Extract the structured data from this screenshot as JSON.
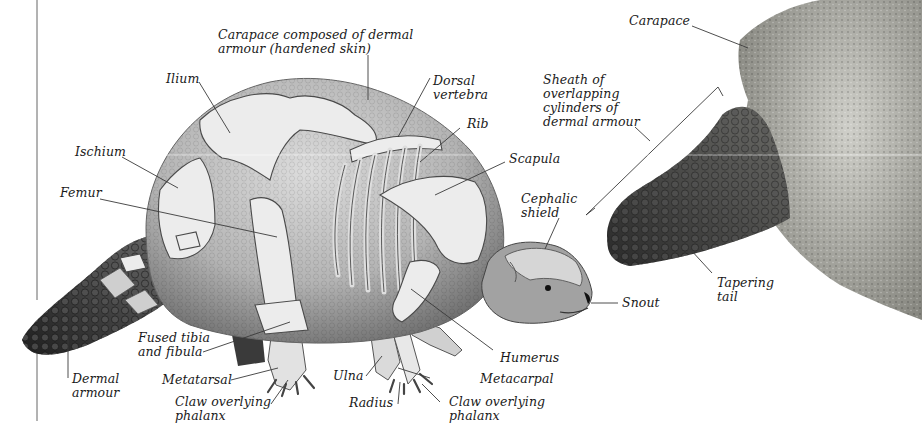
{
  "diagram": {
    "colors": {
      "background": "#ffffff",
      "label_text": "#1a1a1a",
      "leader_line": "#3a3a3a",
      "carapace_light": "#cfcfcf",
      "carapace_dark": "#8a8a8a",
      "bone": "#e6e6e6",
      "armour_dark": "#3e3e3e",
      "detail_carapace": "#9a9a94"
    },
    "main_figure": {
      "labels": [
        {
          "id": "carapace-composed",
          "text": "Carapace composed of dermal\narmour (hardened skin)"
        },
        {
          "id": "ilium",
          "text": "Ilium"
        },
        {
          "id": "dorsal-vertebra",
          "text": "Dorsal\nvertebra"
        },
        {
          "id": "rib",
          "text": "Rib"
        },
        {
          "id": "ischium",
          "text": "Ischium"
        },
        {
          "id": "scapula",
          "text": "Scapula"
        },
        {
          "id": "femur",
          "text": "Femur"
        },
        {
          "id": "cephalic-shield",
          "text": "Cephalic\nshield"
        },
        {
          "id": "snout",
          "text": "Snout"
        },
        {
          "id": "fused-tibia-fibula",
          "text": "Fused tibia\nand fibula"
        },
        {
          "id": "humerus",
          "text": "Humerus"
        },
        {
          "id": "dermal-armour",
          "text": "Dermal\narmour"
        },
        {
          "id": "metatarsal",
          "text": "Metatarsal"
        },
        {
          "id": "ulna",
          "text": "Ulna"
        },
        {
          "id": "metacarpal",
          "text": "Metacarpal"
        },
        {
          "id": "claw-hind",
          "text": "Claw overlying\nphalanx"
        },
        {
          "id": "radius",
          "text": "Radius"
        },
        {
          "id": "claw-fore",
          "text": "Claw overlying\nphalanx"
        }
      ]
    },
    "detail_figure": {
      "labels": [
        {
          "id": "carapace",
          "text": "Carapace"
        },
        {
          "id": "sheath",
          "text": "Sheath of\noverlapping\ncylinders of\ndermal armour"
        },
        {
          "id": "tapering-tail",
          "text": "Tapering\ntail"
        }
      ]
    }
  }
}
